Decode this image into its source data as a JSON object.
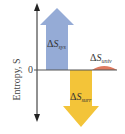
{
  "diagram": {
    "y_axis_label": "Entropy, S",
    "zero_label": "0",
    "arrows": [
      {
        "name": "system",
        "delta": "Δ",
        "symbol": "S",
        "subscript": "sys",
        "direction": "up",
        "color": "#8fa6d4"
      },
      {
        "name": "surroundings",
        "delta": "Δ",
        "symbol": "S",
        "subscript": "surr",
        "direction": "down",
        "color": "#f2c12e"
      },
      {
        "name": "universe",
        "delta": "Δ",
        "symbol": "S",
        "subscript": "univ",
        "direction": "small-positive",
        "color": "#e07a5f"
      }
    ],
    "colors": {
      "axis": "#222222",
      "sys": "#8fa6d4",
      "surr": "#f2c12e",
      "univ": "#e07a5f"
    }
  }
}
